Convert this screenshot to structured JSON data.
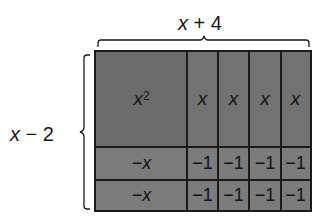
{
  "diagram": {
    "top_dimension": {
      "variable": "x",
      "rest": " + 4"
    },
    "left_dimension": {
      "variable": "x",
      "rest": " − 2"
    },
    "rows": [
      {
        "cells": [
          {
            "var": "x",
            "sup": "2",
            "label": "x²"
          },
          {
            "var": "x"
          },
          {
            "var": "x"
          },
          {
            "var": "x"
          },
          {
            "var": "x"
          }
        ]
      },
      {
        "cells": [
          {
            "prefix": "−",
            "var": "x"
          },
          {
            "text": "−1"
          },
          {
            "text": "−1"
          },
          {
            "text": "−1"
          },
          {
            "text": "−1"
          }
        ]
      },
      {
        "cells": [
          {
            "prefix": "−",
            "var": "x"
          },
          {
            "text": "−1"
          },
          {
            "text": "−1"
          },
          {
            "text": "−1"
          },
          {
            "text": "−1"
          }
        ]
      }
    ],
    "colors": {
      "tile_fill": "#6f6f6f",
      "negative_tile_fill": "#7b7b7b",
      "border": "#1a1a1a"
    }
  }
}
